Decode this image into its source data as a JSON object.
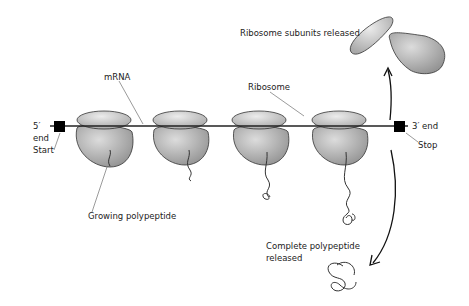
{
  "diagram": {
    "type": "translation-polyribosome",
    "labels": {
      "mrna": "mRNA",
      "ribosome": "Ribosome",
      "five_prime": "5′",
      "five_prime_end": "end",
      "start": "Start",
      "three_prime_end": "3′ end",
      "stop": "Stop",
      "growing_polypeptide": "Growing polypeptide",
      "subunits_released": "Ribosome subunits released",
      "complete_polypeptide_line1": "Complete polypeptide",
      "complete_polypeptide_line2": "released"
    },
    "ribosome_count": 4,
    "colors": {
      "ribosome_fill": "#b8b8b8",
      "ribosome_highlight": "#e2e2e2",
      "outline": "#333333",
      "marker": "#000000"
    }
  }
}
